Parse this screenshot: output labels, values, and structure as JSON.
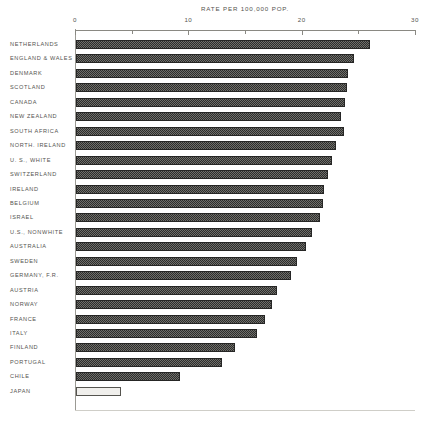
{
  "chart_data": {
    "type": "bar",
    "orientation": "horizontal",
    "title": "RATE PER 100,000 POP.",
    "xlabel": "RATE PER 100,000 POP.",
    "ylabel": "",
    "xlim": [
      0,
      30
    ],
    "xticks": [
      0,
      5,
      10,
      15,
      20,
      25,
      30
    ],
    "xtick_labels": [
      "0",
      "",
      "10",
      "",
      "20",
      "",
      "30"
    ],
    "grid": false,
    "legend": null,
    "categories": [
      "NETHERLANDS",
      "ENGLAND & WALES",
      "DENMARK",
      "SCOTLAND",
      "CANADA",
      "NEW ZEALAND",
      "SOUTH AFRICA",
      "NORTH. IRELAND",
      "U. S., WHITE",
      "SWITZERLAND",
      "IRELAND",
      "BELGIUM",
      "ISRAEL",
      "U.S., NONWHITE",
      "AUSTRALIA",
      "SWEDEN",
      "GERMANY, F.R.",
      "AUSTRIA",
      "NORWAY",
      "FRANCE",
      "ITALY",
      "FINLAND",
      "PORTUGAL",
      "CHILE",
      "JAPAN"
    ],
    "values": [
      26.0,
      24.6,
      24.1,
      24.0,
      23.8,
      23.5,
      23.7,
      23.0,
      22.7,
      22.3,
      22.0,
      21.9,
      21.6,
      20.9,
      20.4,
      19.6,
      19.1,
      17.8,
      17.4,
      16.8,
      16.1,
      14.1,
      13.0,
      9.3,
      4.1
    ],
    "bar_styles": [
      "hatched",
      "hatched",
      "hatched",
      "hatched",
      "hatched",
      "hatched",
      "hatched",
      "hatched",
      "hatched",
      "hatched",
      "hatched",
      "hatched",
      "hatched",
      "hatched",
      "hatched",
      "hatched",
      "hatched",
      "hatched",
      "hatched",
      "hatched",
      "hatched",
      "hatched",
      "hatched",
      "hatched",
      "hollow"
    ],
    "colors": {
      "bar_fill": "#3a3a38",
      "bar_edge": "#262625",
      "hollow_fill": "#f0efec",
      "axis": "#8a8983",
      "text": "#55544f",
      "background": "#ffffff"
    }
  }
}
